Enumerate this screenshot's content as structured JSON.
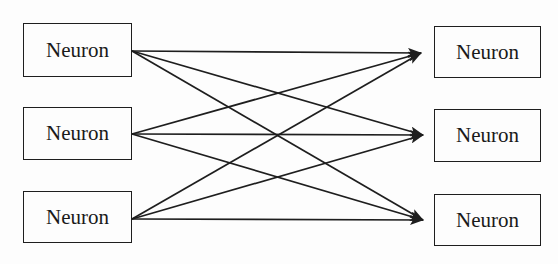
{
  "diagram": {
    "type": "fully-connected-layer",
    "colors": {
      "stroke": "#1e1e1e",
      "background": "#fdfdfd",
      "text": "#1a1a1a"
    },
    "input_layer": [
      {
        "id": "in1",
        "label": "Neuron",
        "box": [
          23,
          23,
          109,
          54
        ]
      },
      {
        "id": "in2",
        "label": "Neuron",
        "box": [
          23,
          107,
          109,
          53
        ]
      },
      {
        "id": "in3",
        "label": "Neuron",
        "box": [
          23,
          191,
          109,
          52
        ]
      }
    ],
    "output_layer": [
      {
        "id": "out1",
        "label": "Neuron",
        "box": [
          434,
          26,
          107,
          52
        ]
      },
      {
        "id": "out2",
        "label": "Neuron",
        "box": [
          434,
          109,
          107,
          53
        ]
      },
      {
        "id": "out3",
        "label": "Neuron",
        "box": [
          434,
          194,
          107,
          52
        ]
      }
    ],
    "edges": [
      {
        "from": "in1",
        "to": "out1"
      },
      {
        "from": "in1",
        "to": "out2"
      },
      {
        "from": "in1",
        "to": "out3"
      },
      {
        "from": "in2",
        "to": "out1"
      },
      {
        "from": "in2",
        "to": "out2"
      },
      {
        "from": "in2",
        "to": "out3"
      },
      {
        "from": "in3",
        "to": "out1"
      },
      {
        "from": "in3",
        "to": "out2"
      },
      {
        "from": "in3",
        "to": "out3"
      }
    ],
    "anchors": {
      "in1": [
        132,
        51
      ],
      "in2": [
        132,
        134
      ],
      "in3": [
        132,
        219
      ],
      "out1": [
        421,
        53
      ],
      "out2": [
        423,
        135
      ],
      "out3": [
        423,
        220
      ]
    }
  }
}
